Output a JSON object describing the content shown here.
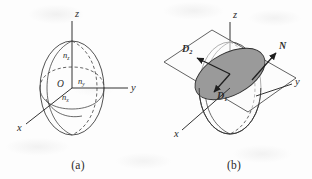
{
  "figure": {
    "background_color": "#fdfdfd",
    "ink_color": "#333333",
    "shaded_ellipse_color": "#9a9a9a"
  },
  "panel_a": {
    "caption": "(a)",
    "axes": [
      {
        "name": "z",
        "label": "z",
        "direction": "up"
      },
      {
        "name": "y",
        "label": "y",
        "direction": "right"
      },
      {
        "name": "x",
        "label": "x",
        "direction": "lower-left"
      }
    ],
    "origin_label": "O",
    "semi_axis_labels": [
      {
        "name": "n-z",
        "base": "n",
        "sub": "z"
      },
      {
        "name": "n-y",
        "base": "n",
        "sub": "y"
      },
      {
        "name": "n-x",
        "base": "n",
        "sub": "x"
      }
    ]
  },
  "panel_b": {
    "caption": "(b)",
    "axes": [
      {
        "name": "z",
        "label": "z",
        "direction": "up"
      },
      {
        "name": "y",
        "label": "y",
        "direction": "right"
      },
      {
        "name": "x",
        "label": "x",
        "direction": "lower-left"
      }
    ],
    "vectors": [
      {
        "name": "D2",
        "base": "D",
        "sub": "2",
        "direction": "upper-left"
      },
      {
        "name": "D1",
        "base": "D",
        "sub": "1",
        "direction": "lower-left"
      },
      {
        "name": "N",
        "base": "N",
        "sub": "",
        "direction": "upper-right"
      }
    ],
    "shaded_region": "elliptical cross-section"
  }
}
